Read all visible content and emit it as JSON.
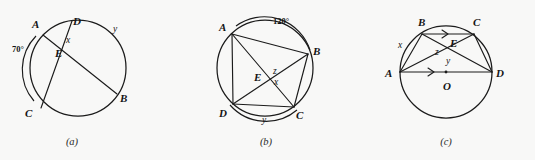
{
  "figure": {
    "background_color": "#f8f8f7",
    "ink_color": "#1b1b1b",
    "panels": [
      {
        "caption": "(a)",
        "description": "Two chords AB and CD of a circle intersecting at interior point E",
        "points": [
          "A",
          "B",
          "C",
          "D",
          "E"
        ],
        "labels": {
          "A": "A",
          "B": "B",
          "C": "C",
          "D": "D",
          "E": "E",
          "x": "x",
          "y": "y",
          "angle_arc": "70°"
        }
      },
      {
        "caption": "(b)",
        "description": "Cyclic quadrilateral ABCD with diagonals AC and BD meeting at E",
        "points": [
          "A",
          "B",
          "C",
          "D",
          "E"
        ],
        "labels": {
          "A": "A",
          "B": "B",
          "C": "C",
          "D": "D",
          "E": "E",
          "x": "x",
          "z": "z",
          "y": "y",
          "angle_arc": "120°"
        }
      },
      {
        "caption": "(c)",
        "description": "Circle with centre O, diameter AD, chord BC parallel to AD, diagonals meeting at E",
        "points": [
          "A",
          "B",
          "C",
          "D",
          "E",
          "O"
        ],
        "labels": {
          "A": "A",
          "B": "B",
          "C": "C",
          "D": "D",
          "E": "E",
          "O": "O",
          "x": "x",
          "y": "y",
          "z": "z"
        }
      }
    ]
  }
}
